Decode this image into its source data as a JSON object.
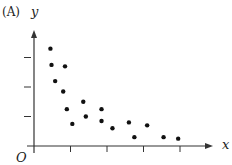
{
  "panel_label": "(A)",
  "chart_data": {
    "type": "scatter",
    "title": "",
    "xlabel": "x",
    "ylabel": "y",
    "origin_label": "O",
    "grid": false,
    "legend": null,
    "x_ticks": 4,
    "y_ticks": 3,
    "xlim": [
      0,
      5
    ],
    "ylim": [
      0,
      3.9
    ],
    "points": [
      {
        "x": 0.45,
        "y": 3.3
      },
      {
        "x": 0.48,
        "y": 2.75
      },
      {
        "x": 0.85,
        "y": 2.7
      },
      {
        "x": 0.58,
        "y": 2.2
      },
      {
        "x": 0.8,
        "y": 1.85
      },
      {
        "x": 0.9,
        "y": 1.25
      },
      {
        "x": 1.05,
        "y": 0.75
      },
      {
        "x": 1.35,
        "y": 1.5
      },
      {
        "x": 1.42,
        "y": 1.0
      },
      {
        "x": 1.85,
        "y": 1.25
      },
      {
        "x": 1.85,
        "y": 0.85
      },
      {
        "x": 2.15,
        "y": 0.6
      },
      {
        "x": 2.6,
        "y": 0.8
      },
      {
        "x": 2.75,
        "y": 0.3
      },
      {
        "x": 3.1,
        "y": 0.7
      },
      {
        "x": 3.55,
        "y": 0.3
      },
      {
        "x": 3.95,
        "y": 0.25
      }
    ]
  },
  "colors": {
    "axis": "#333333",
    "points": "#111111"
  }
}
